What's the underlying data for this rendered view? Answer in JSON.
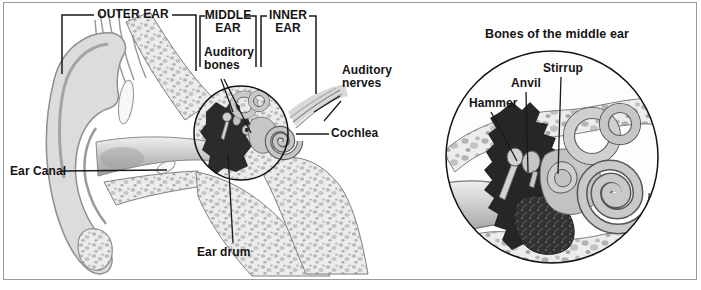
{
  "window": {
    "background": "#ffffff",
    "frame_border_color": "#9b9b9b"
  },
  "main_diagram": {
    "description": "Cross-section of the human ear",
    "region_brackets": [
      {
        "label": "OUTER EAR"
      },
      {
        "label": "MIDDLE EAR"
      },
      {
        "label": "INNER EAR"
      }
    ],
    "part_labels": {
      "auditory_bones": "Auditory bones",
      "auditory_nerves": "Auditory nerves",
      "cochlea": "Cochlea",
      "ear_canal": "Ear Canal",
      "ear_drum": "Ear drum"
    }
  },
  "inset_diagram": {
    "title": "Bones of the middle ear",
    "part_labels": {
      "hammer": "Hammer",
      "anvil": "Anvil",
      "stirrup": "Stirrup"
    }
  },
  "palette": {
    "text": "#141414",
    "leader_line": "#1a1a1a",
    "cavity_dark": "#2b2b2b",
    "bone_light": "#ececec",
    "bone_speckle": "#b9b9b9",
    "tissue_gray": "#c9c9c9"
  }
}
